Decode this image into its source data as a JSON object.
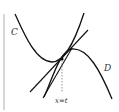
{
  "diagram": {
    "labels": {
      "curve_c": "C",
      "curve_d": "D",
      "vertical_line": "x=t"
    },
    "colors": {
      "stroke": "#111111",
      "dashed": "#777777",
      "text": "#333333",
      "border": "#999999"
    }
  }
}
